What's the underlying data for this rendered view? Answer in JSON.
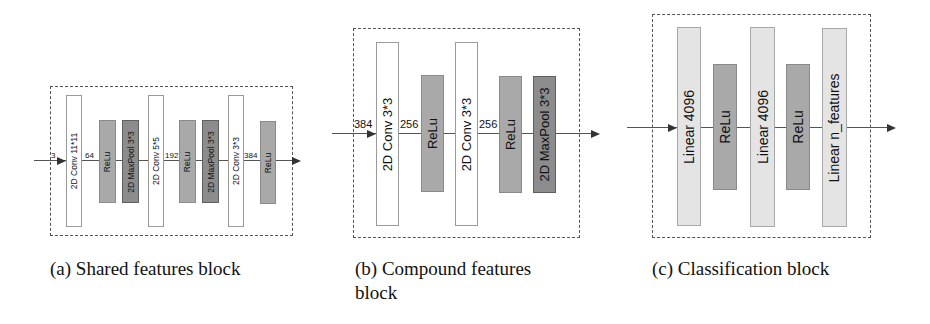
{
  "figure": {
    "panels": [
      {
        "id": "a",
        "caption": "(a) Shared features block",
        "input_dim": "3",
        "blocks": [
          {
            "type": "conv",
            "label": "2D Conv 11*11"
          },
          {
            "type": "relu",
            "label": "ReLu"
          },
          {
            "type": "pool",
            "label": "2D MaxPool 3*3"
          },
          {
            "type": "conv",
            "label": "2D Conv 5*5"
          },
          {
            "type": "relu",
            "label": "ReLu"
          },
          {
            "type": "pool",
            "label": "2D MaxPool 3*3"
          },
          {
            "type": "conv",
            "label": "2D Conv 3*3"
          },
          {
            "type": "relu",
            "label": "ReLu"
          }
        ],
        "edge_labels": [
          "64",
          "192",
          "384"
        ]
      },
      {
        "id": "b",
        "caption_line1": "(b) Compound features",
        "caption_line2": "block",
        "input_dim": "384",
        "blocks": [
          {
            "type": "conv",
            "label": "2D Conv 3*3"
          },
          {
            "type": "relu",
            "label": "ReLu"
          },
          {
            "type": "conv",
            "label": "2D Conv 3*3"
          },
          {
            "type": "relu",
            "label": "ReLu"
          },
          {
            "type": "pool",
            "label": "2D MaxPool 3*3"
          }
        ],
        "edge_labels": [
          "256",
          "256"
        ]
      },
      {
        "id": "c",
        "caption": "(c) Classification block",
        "blocks": [
          {
            "type": "linear",
            "label": "Linear 4096"
          },
          {
            "type": "relu",
            "label": "ReLu"
          },
          {
            "type": "linear",
            "label": "Linear 4096"
          },
          {
            "type": "relu",
            "label": "ReLu"
          },
          {
            "type": "linear",
            "label": "Linear n_features"
          }
        ]
      }
    ],
    "colors": {
      "conv": "#ffffff",
      "relu": "#a9a9a9",
      "pool": "#8c8c8c",
      "linear": "#e4e4e4",
      "dash_border": "#555555"
    }
  }
}
